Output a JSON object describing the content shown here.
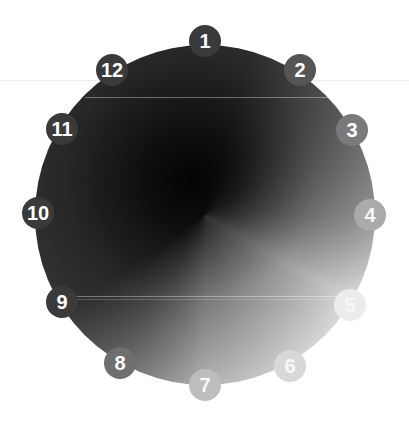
{
  "diagram": {
    "type": "clock-dial-gradient",
    "center": [
      205,
      215
    ],
    "radius": 170,
    "markers": [
      {
        "label": "1",
        "x": 205,
        "y": 41,
        "color": "#3a3a3a"
      },
      {
        "label": "2",
        "x": 300,
        "y": 70,
        "color": "#555555"
      },
      {
        "label": "3",
        "x": 352,
        "y": 130,
        "color": "#7a7a7a"
      },
      {
        "label": "4",
        "x": 370,
        "y": 215,
        "color": "#aaaaaa"
      },
      {
        "label": "5",
        "x": 350,
        "y": 305,
        "color": "#ececec"
      },
      {
        "label": "6",
        "x": 290,
        "y": 366,
        "color": "#d8d8d8"
      },
      {
        "label": "7",
        "x": 205,
        "y": 385,
        "color": "#bdbdbd"
      },
      {
        "label": "8",
        "x": 120,
        "y": 363,
        "color": "#6f6f6f"
      },
      {
        "label": "9",
        "x": 62,
        "y": 302,
        "color": "#3a3a3a"
      },
      {
        "label": "10",
        "x": 38,
        "y": 213,
        "color": "#3a3a3a"
      },
      {
        "label": "11",
        "x": 62,
        "y": 129,
        "color": "#3a3a3a"
      },
      {
        "label": "12",
        "x": 112,
        "y": 70,
        "color": "#3a3a3a"
      }
    ],
    "colors": {
      "dark": "#3a3a3a",
      "center": "#0a0a0a",
      "lightest": "#ececec",
      "background": "#ffffff"
    }
  }
}
